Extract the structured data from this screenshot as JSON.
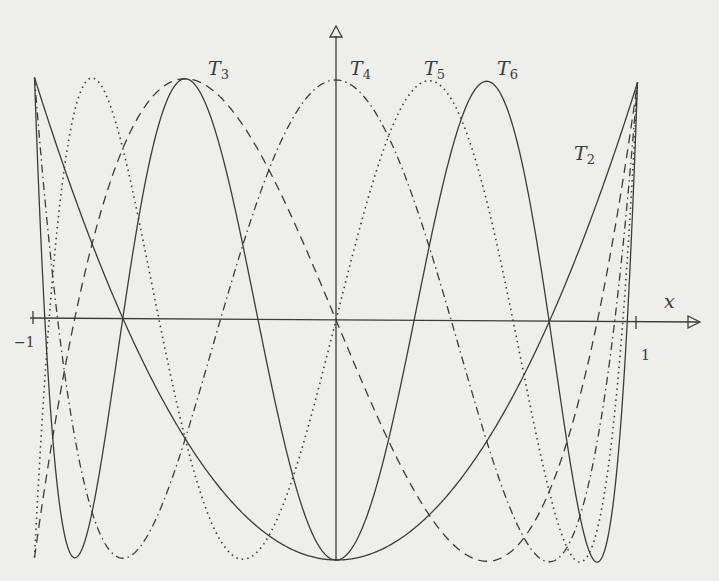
{
  "chart_data": {
    "type": "line",
    "title": "",
    "xlabel": "x",
    "ylabel": "",
    "xlim": [
      -1,
      1
    ],
    "ylim": [
      -1,
      1
    ],
    "x_ticks": [
      {
        "value": -1,
        "label": "−1"
      },
      {
        "value": 1,
        "label": "1"
      }
    ],
    "grid": false,
    "series": [
      {
        "name": "T2",
        "label_main": "T",
        "label_sub": "2",
        "style": "solid",
        "coeffs_desc": [
          2,
          0,
          -1
        ],
        "label_pos": [
          574,
          160
        ]
      },
      {
        "name": "T3",
        "label_main": "T",
        "label_sub": "3",
        "style": "dashed",
        "coeffs_desc": [
          4,
          0,
          -3,
          0
        ],
        "label_pos": [
          208,
          75
        ]
      },
      {
        "name": "T4",
        "label_main": "T",
        "label_sub": "4",
        "style": "dashdot",
        "coeffs_desc": [
          8,
          0,
          -8,
          0,
          1
        ],
        "label_pos": [
          350,
          75
        ]
      },
      {
        "name": "T5",
        "label_main": "T",
        "label_sub": "5",
        "style": "dotted",
        "coeffs_desc": [
          16,
          0,
          -20,
          0,
          5,
          0
        ],
        "label_pos": [
          424,
          75
        ]
      },
      {
        "name": "T6",
        "label_main": "T",
        "label_sub": "6",
        "style": "solid",
        "coeffs_desc": [
          32,
          0,
          -48,
          0,
          18,
          0,
          -1
        ],
        "label_pos": [
          497,
          75
        ]
      }
    ]
  },
  "axes": {
    "x_axis_label": "x",
    "origin_px": [
      336,
      320
    ],
    "x_scale_px": 301.5,
    "y_scale_px": 240,
    "stroke": "#3c3c3c"
  }
}
